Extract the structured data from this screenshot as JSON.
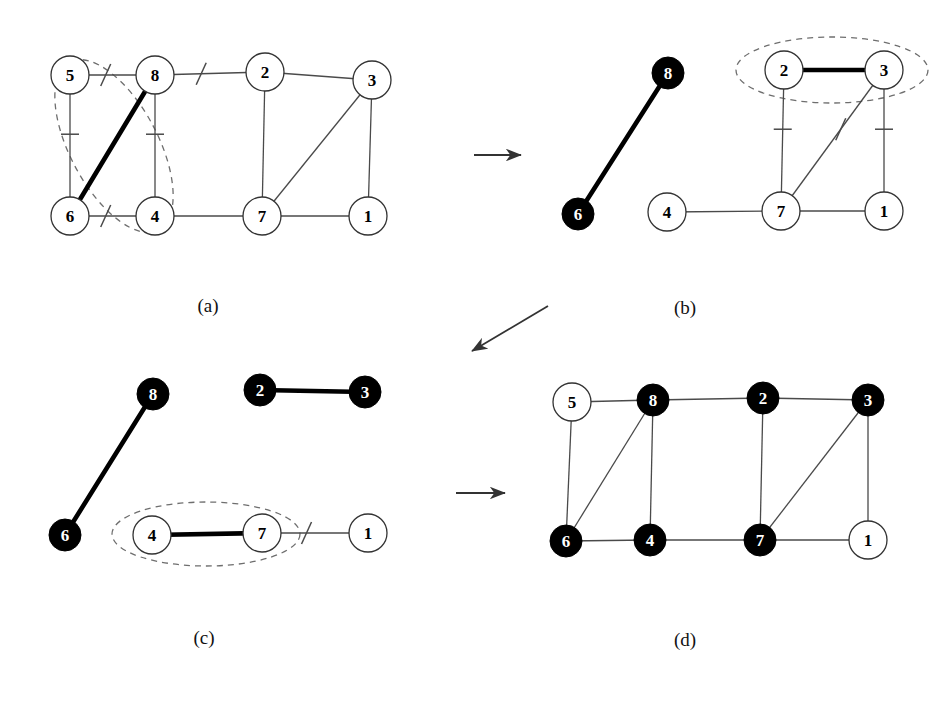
{
  "figure": {
    "background_color": "#ffffff",
    "line_color": "#4a4a4a",
    "bold_line_color": "#000000",
    "dashed_color": "#6e6e6e",
    "node_fill_white": "#ffffff",
    "node_fill_black": "#000000",
    "node_stroke": "#333333",
    "node_radius": 19,
    "node_radius_solid": 16,
    "arrow_color": "#333333"
  },
  "panels": [
    {
      "id": "a",
      "label": "(a)",
      "label_pos": {
        "x": 208,
        "y": 312
      },
      "nodes": [
        {
          "id": "5",
          "label": "5",
          "x": 70,
          "y": 75,
          "fill": "white",
          "r": 19
        },
        {
          "id": "8",
          "label": "8",
          "x": 155,
          "y": 75,
          "fill": "white",
          "r": 19
        },
        {
          "id": "2",
          "label": "2",
          "x": 265,
          "y": 72,
          "fill": "white",
          "r": 19
        },
        {
          "id": "3",
          "label": "3",
          "x": 372,
          "y": 80,
          "fill": "white",
          "r": 19
        },
        {
          "id": "6",
          "label": "6",
          "x": 70,
          "y": 216,
          "fill": "white",
          "r": 19
        },
        {
          "id": "4",
          "label": "4",
          "x": 155,
          "y": 216,
          "fill": "white",
          "r": 19
        },
        {
          "id": "7",
          "label": "7",
          "x": 262,
          "y": 216,
          "fill": "white",
          "r": 19
        },
        {
          "id": "1",
          "label": "1",
          "x": 368,
          "y": 216,
          "fill": "white",
          "r": 19
        }
      ],
      "edges": [
        {
          "from": "5",
          "to": "8",
          "style": "thin",
          "mark": "slash"
        },
        {
          "from": "8",
          "to": "2",
          "style": "thin",
          "mark": "slash"
        },
        {
          "from": "2",
          "to": "3",
          "style": "thin",
          "mark": "none"
        },
        {
          "from": "5",
          "to": "6",
          "style": "thin",
          "mark": "tick"
        },
        {
          "from": "8",
          "to": "4",
          "style": "thin",
          "mark": "tick"
        },
        {
          "from": "2",
          "to": "7",
          "style": "thin",
          "mark": "none"
        },
        {
          "from": "3",
          "to": "1",
          "style": "thin",
          "mark": "none"
        },
        {
          "from": "3",
          "to": "7",
          "style": "thin",
          "mark": "none"
        },
        {
          "from": "6",
          "to": "4",
          "style": "thin",
          "mark": "slash"
        },
        {
          "from": "4",
          "to": "7",
          "style": "thin",
          "mark": "none"
        },
        {
          "from": "7",
          "to": "1",
          "style": "thin",
          "mark": "none"
        },
        {
          "from": "6",
          "to": "8",
          "style": "bold",
          "mark": "none"
        }
      ],
      "ellipses": [
        {
          "cx": 114,
          "cy": 146,
          "rx": 44,
          "ry": 95,
          "rotate": -28
        }
      ]
    },
    {
      "id": "b",
      "label": "(b)",
      "label_pos": {
        "x": 685,
        "y": 314
      },
      "nodes": [
        {
          "id": "8",
          "label": "8",
          "x": 668,
          "y": 73,
          "fill": "black",
          "r": 16
        },
        {
          "id": "2",
          "label": "2",
          "x": 784,
          "y": 70,
          "fill": "white",
          "r": 19
        },
        {
          "id": "3",
          "label": "3",
          "x": 884,
          "y": 70,
          "fill": "white",
          "r": 19
        },
        {
          "id": "6",
          "label": "6",
          "x": 578,
          "y": 214,
          "fill": "black",
          "r": 16
        },
        {
          "id": "4",
          "label": "4",
          "x": 667,
          "y": 212,
          "fill": "white",
          "r": 19
        },
        {
          "id": "7",
          "label": "7",
          "x": 781,
          "y": 211,
          "fill": "white",
          "r": 19
        },
        {
          "id": "1",
          "label": "1",
          "x": 884,
          "y": 211,
          "fill": "white",
          "r": 19
        }
      ],
      "edges": [
        {
          "from": "6",
          "to": "8",
          "style": "bold",
          "mark": "none"
        },
        {
          "from": "2",
          "to": "3",
          "style": "bold",
          "mark": "none"
        },
        {
          "from": "2",
          "to": "7",
          "style": "thin",
          "mark": "tick"
        },
        {
          "from": "3",
          "to": "1",
          "style": "thin",
          "mark": "tick"
        },
        {
          "from": "3",
          "to": "7",
          "style": "thin",
          "mark": "slash"
        },
        {
          "from": "4",
          "to": "7",
          "style": "thin",
          "mark": "none"
        },
        {
          "from": "7",
          "to": "1",
          "style": "thin",
          "mark": "none"
        }
      ],
      "ellipses": [
        {
          "cx": 832,
          "cy": 70,
          "rx": 96,
          "ry": 33,
          "rotate": 0
        }
      ]
    },
    {
      "id": "c",
      "label": "(c)",
      "label_pos": {
        "x": 204,
        "y": 644
      },
      "nodes": [
        {
          "id": "8",
          "label": "8",
          "x": 153,
          "y": 394,
          "fill": "black",
          "r": 16
        },
        {
          "id": "2",
          "label": "2",
          "x": 260,
          "y": 390,
          "fill": "black",
          "r": 16
        },
        {
          "id": "3",
          "label": "3",
          "x": 365,
          "y": 392,
          "fill": "black",
          "r": 16
        },
        {
          "id": "6",
          "label": "6",
          "x": 65,
          "y": 535,
          "fill": "black",
          "r": 16
        },
        {
          "id": "4",
          "label": "4",
          "x": 152,
          "y": 535,
          "fill": "white",
          "r": 19
        },
        {
          "id": "7",
          "label": "7",
          "x": 262,
          "y": 533,
          "fill": "white",
          "r": 19
        },
        {
          "id": "1",
          "label": "1",
          "x": 368,
          "y": 533,
          "fill": "white",
          "r": 19
        }
      ],
      "edges": [
        {
          "from": "6",
          "to": "8",
          "style": "bold",
          "mark": "none"
        },
        {
          "from": "2",
          "to": "3",
          "style": "bold",
          "mark": "none"
        },
        {
          "from": "4",
          "to": "7",
          "style": "bold",
          "mark": "none"
        },
        {
          "from": "7",
          "to": "1",
          "style": "thin",
          "mark": "slash"
        }
      ],
      "ellipses": [
        {
          "cx": 206,
          "cy": 534,
          "rx": 94,
          "ry": 32,
          "rotate": 0
        }
      ]
    },
    {
      "id": "d",
      "label": "(d)",
      "label_pos": {
        "x": 685,
        "y": 646
      },
      "nodes": [
        {
          "id": "5",
          "label": "5",
          "x": 572,
          "y": 402,
          "fill": "white",
          "r": 19
        },
        {
          "id": "8",
          "label": "8",
          "x": 653,
          "y": 400,
          "fill": "black",
          "r": 16
        },
        {
          "id": "2",
          "label": "2",
          "x": 763,
          "y": 398,
          "fill": "black",
          "r": 16
        },
        {
          "id": "3",
          "label": "3",
          "x": 868,
          "y": 400,
          "fill": "black",
          "r": 16
        },
        {
          "id": "6",
          "label": "6",
          "x": 566,
          "y": 541,
          "fill": "black",
          "r": 16
        },
        {
          "id": "4",
          "label": "4",
          "x": 650,
          "y": 540,
          "fill": "black",
          "r": 16
        },
        {
          "id": "7",
          "label": "7",
          "x": 760,
          "y": 540,
          "fill": "black",
          "r": 16
        },
        {
          "id": "1",
          "label": "1",
          "x": 868,
          "y": 540,
          "fill": "white",
          "r": 19
        }
      ],
      "edges": [
        {
          "from": "5",
          "to": "8",
          "style": "thin",
          "mark": "none"
        },
        {
          "from": "8",
          "to": "2",
          "style": "thin",
          "mark": "none"
        },
        {
          "from": "2",
          "to": "3",
          "style": "thin",
          "mark": "none"
        },
        {
          "from": "5",
          "to": "6",
          "style": "thin",
          "mark": "none"
        },
        {
          "from": "8",
          "to": "4",
          "style": "thin",
          "mark": "none"
        },
        {
          "from": "8",
          "to": "6",
          "style": "thin",
          "mark": "none"
        },
        {
          "from": "2",
          "to": "7",
          "style": "thin",
          "mark": "none"
        },
        {
          "from": "3",
          "to": "1",
          "style": "thin",
          "mark": "none"
        },
        {
          "from": "3",
          "to": "7",
          "style": "thin",
          "mark": "none"
        },
        {
          "from": "6",
          "to": "4",
          "style": "thin",
          "mark": "none"
        },
        {
          "from": "4",
          "to": "7",
          "style": "thin",
          "mark": "none"
        },
        {
          "from": "7",
          "to": "1",
          "style": "thin",
          "mark": "none"
        }
      ],
      "ellipses": []
    }
  ],
  "arrows": [
    {
      "id": "a-to-b",
      "x1": 474,
      "y1": 155,
      "x2": 521,
      "y2": 155
    },
    {
      "id": "b-to-c",
      "x1": 548,
      "y1": 306,
      "x2": 472,
      "y2": 351
    },
    {
      "id": "c-to-d",
      "x1": 456,
      "y1": 493,
      "x2": 505,
      "y2": 493
    }
  ]
}
